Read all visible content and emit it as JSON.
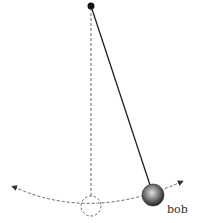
{
  "diagram": {
    "labels": {
      "bob": "bob"
    },
    "elements": {
      "pivot": {
        "x": 91,
        "y": 6,
        "r": 3.5
      },
      "rest_line": {
        "x1": 91,
        "y1": 8,
        "x2": 91,
        "y2": 196
      },
      "rest_position_circle": {
        "cx": 91,
        "cy": 206,
        "r": 10
      },
      "string": {
        "x1": 91,
        "y1": 6,
        "x2": 151,
        "y2": 184
      },
      "bob": {
        "cx": 153,
        "cy": 195,
        "r": 11
      },
      "swing_arc": {
        "from": [
          12,
          187
        ],
        "through": [
          91,
          206
        ],
        "to": [
          183,
          181
        ]
      }
    },
    "colors": {
      "line": "#222222",
      "dashed": "#666666",
      "bob_dark": "#2a2a2a",
      "bob_light": "#d8d8d8"
    }
  }
}
